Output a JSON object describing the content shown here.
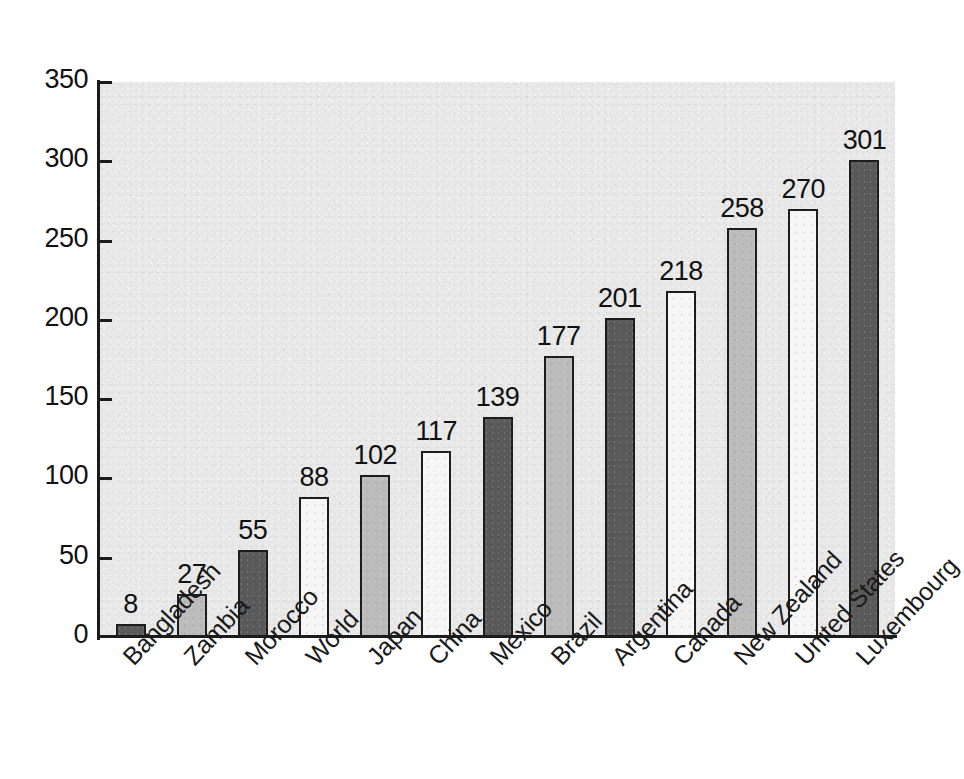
{
  "top_caption": "clipped text line",
  "chart_data": {
    "type": "bar",
    "title": "",
    "subtitle": "",
    "xlabel": "",
    "ylabel": "",
    "ylim": [
      0,
      350
    ],
    "ytick_labels": [
      "0",
      "50",
      "100",
      "150",
      "200",
      "250",
      "300",
      "350"
    ],
    "yticks": [
      0,
      50,
      100,
      150,
      200,
      250,
      300,
      350
    ],
    "grid": false,
    "legend": "none",
    "categories": [
      "Bangladesh",
      "Zambia",
      "Morocco",
      "World",
      "Japan",
      "China",
      "Mexico",
      "Brazil",
      "Argentina",
      "Canada",
      "New Zealand",
      "United States",
      "Luxembourg"
    ],
    "values": [
      8,
      27,
      55,
      88,
      102,
      117,
      139,
      177,
      201,
      218,
      258,
      270,
      301
    ],
    "bar_fills": [
      "dark",
      "mid",
      "dark",
      "light",
      "mid",
      "light",
      "dark",
      "mid",
      "dark",
      "light",
      "mid",
      "light",
      "dark"
    ],
    "data_labels": [
      "8",
      "27",
      "55",
      "88",
      "102",
      "117",
      "139",
      "177",
      "201",
      "218",
      "258",
      "270",
      "301"
    ]
  },
  "colors": {
    "plot_background": "#e8e8e8",
    "axis": "#1b1b1b",
    "bar_outline": "#1d1d1d",
    "fill_dark": "#5a5a5a",
    "fill_mid": "#bcbcbc",
    "fill_light": "#f6f6f6",
    "text": "#111111",
    "page_background": "#ffffff"
  }
}
